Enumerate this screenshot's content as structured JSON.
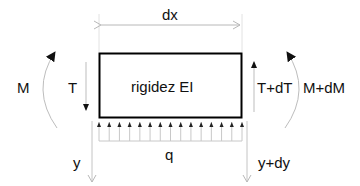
{
  "diagram": {
    "element": {
      "label": "rigidez  EI",
      "width_label": "dx",
      "border_color": "#000000"
    },
    "left_face": {
      "moment_label": "M",
      "shear_label": "T",
      "deflection_label": "y"
    },
    "right_face": {
      "moment_label": "M+dM",
      "shear_label": "T+dT",
      "deflection_label": "y+dy"
    },
    "load": {
      "label": "q",
      "arrow_count": 15,
      "direction": "up"
    },
    "colors": {
      "ink": "#111111",
      "light_line": "#b8b8b8",
      "extension_line": "#e2e2e2"
    }
  }
}
